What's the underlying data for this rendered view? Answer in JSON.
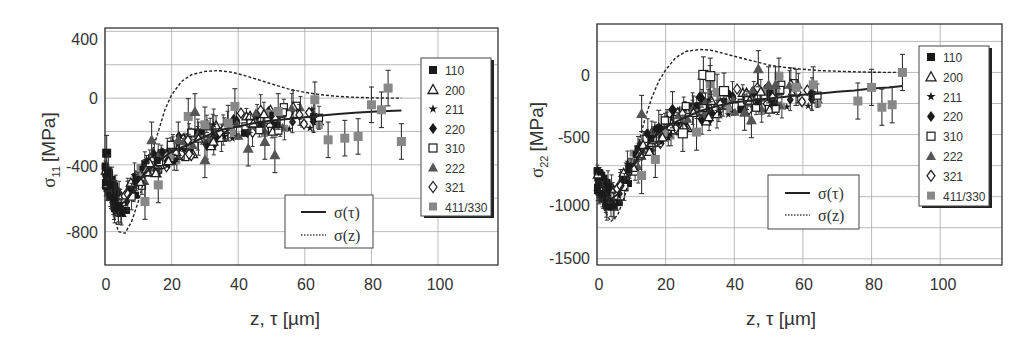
{
  "chart_data": [
    {
      "type": "scatter",
      "id": "sigma11",
      "ylabel": "σ11 [MPa]",
      "ylabel_main": "σ",
      "ylabel_sub": "11",
      "ylabel_unit": "[MPa]",
      "xlabel": "z, τ [µm]",
      "xlim": [
        0,
        118
      ],
      "ylim": [
        -1000,
        420
      ],
      "x_ticks": [
        0,
        20,
        40,
        60,
        80,
        100
      ],
      "y_ticks": [
        400,
        0,
        -400,
        -800
      ],
      "y_grid": [
        400,
        200,
        0,
        -200,
        -400,
        -600,
        -800
      ],
      "grid": true,
      "legend_reflections": [
        "110",
        "200",
        "211",
        "220",
        "310",
        "222",
        "321",
        "411/330"
      ],
      "legend_curves": [
        "σ(τ)",
        "σ(z)"
      ],
      "series": [
        {
          "name": "σ(τ)",
          "style": "solid",
          "x": [
            0,
            2,
            4,
            6,
            8,
            10,
            12,
            15,
            18,
            20,
            25,
            30,
            35,
            40,
            45,
            50,
            55,
            60,
            65,
            70,
            75,
            80,
            85,
            89
          ],
          "y": [
            -450,
            -560,
            -640,
            -620,
            -560,
            -500,
            -450,
            -400,
            -350,
            -320,
            -280,
            -230,
            -190,
            -170,
            -150,
            -135,
            -125,
            -115,
            -105,
            -95,
            -88,
            -82,
            -78,
            -75
          ]
        },
        {
          "name": "σ(z)",
          "style": "dashed",
          "x": [
            0,
            2,
            4,
            6,
            8,
            10,
            12,
            14,
            16,
            18,
            20,
            23,
            26,
            30,
            34,
            38,
            42,
            46,
            50,
            55,
            60,
            65,
            70,
            75,
            80,
            85,
            89
          ],
          "y": [
            -450,
            -650,
            -800,
            -810,
            -740,
            -620,
            -470,
            -330,
            -200,
            -70,
            20,
            100,
            140,
            160,
            165,
            155,
            135,
            110,
            85,
            55,
            35,
            20,
            10,
            5,
            2,
            0,
            0
          ]
        },
        {
          "name": "411/330",
          "style": "marker",
          "x": [
            12,
            16,
            25,
            30,
            37,
            39,
            52,
            63,
            67,
            72,
            76,
            80,
            83,
            85,
            89
          ],
          "y": [
            -620,
            -520,
            -110,
            -160,
            -150,
            -50,
            -80,
            -10,
            -250,
            -240,
            -230,
            -40,
            -70,
            60,
            -260
          ]
        },
        {
          "name": "222",
          "style": "marker",
          "x": [
            14,
            22,
            27,
            30,
            43,
            48,
            51
          ],
          "y": [
            -250,
            -250,
            -80,
            -370,
            -300,
            -260,
            -340
          ]
        },
        {
          "name": "110",
          "style": "marker",
          "x": [
            0.5,
            1,
            2,
            3,
            4
          ],
          "y": [
            -330,
            -450,
            -520,
            -600,
            -650
          ]
        }
      ]
    },
    {
      "type": "scatter",
      "id": "sigma22",
      "ylabel": "σ22 [MPa]",
      "ylabel_main": "σ",
      "ylabel_sub": "22",
      "ylabel_unit": "[MPa]",
      "xlabel": "z, τ [µm]",
      "xlim": [
        0,
        118
      ],
      "ylim": [
        -1550,
        390
      ],
      "x_ticks": [
        0,
        20,
        40,
        60,
        80,
        100
      ],
      "y_ticks": [
        0,
        -500,
        -1000,
        -1500
      ],
      "y_grid": [
        250,
        0,
        -250,
        -500,
        -750,
        -1000,
        -1250,
        -1500
      ],
      "grid": true,
      "legend_reflections": [
        "110",
        "200",
        "211",
        "220",
        "310",
        "222",
        "321",
        "411/330"
      ],
      "legend_curves": [
        "σ(τ)",
        "σ(z)"
      ],
      "series": [
        {
          "name": "σ(τ)",
          "style": "solid",
          "x": [
            0,
            2,
            4,
            6,
            8,
            10,
            13,
            16,
            20,
            25,
            30,
            35,
            40,
            45,
            50,
            55,
            60,
            65,
            70,
            75,
            80,
            85,
            89
          ],
          "y": [
            -850,
            -950,
            -1020,
            -980,
            -880,
            -770,
            -650,
            -540,
            -440,
            -370,
            -310,
            -270,
            -240,
            -225,
            -210,
            -195,
            -180,
            -170,
            -155,
            -145,
            -130,
            -120,
            -110
          ]
        },
        {
          "name": "σ(z)",
          "style": "dashed",
          "x": [
            0,
            2,
            4,
            6,
            8,
            10,
            12,
            14,
            16,
            18,
            20,
            23,
            26,
            30,
            33,
            36,
            40,
            45,
            50,
            55,
            60,
            65,
            70,
            75,
            80,
            85,
            89
          ],
          "y": [
            -900,
            -1100,
            -1200,
            -1150,
            -1000,
            -800,
            -580,
            -370,
            -200,
            -70,
            20,
            120,
            170,
            185,
            180,
            160,
            130,
            95,
            60,
            40,
            25,
            15,
            10,
            5,
            2,
            0,
            0
          ]
        },
        {
          "name": "411/330",
          "style": "marker",
          "x": [
            13,
            17,
            29,
            33,
            35,
            53,
            58,
            63,
            76,
            80,
            83,
            86,
            89
          ],
          "y": [
            -830,
            -700,
            -480,
            -90,
            -160,
            -30,
            -120,
            -100,
            -230,
            -120,
            -280,
            -260,
            0
          ]
        },
        {
          "name": "222",
          "style": "marker",
          "x": [
            13,
            47,
            50,
            52,
            43,
            45
          ],
          "y": [
            -330,
            30,
            -100,
            -100,
            -320,
            -380
          ]
        },
        {
          "name": "310",
          "style": "marker",
          "x": [
            31,
            33,
            37,
            25
          ],
          "y": [
            -20,
            -30,
            -150,
            -490
          ]
        },
        {
          "name": "220",
          "style": "marker",
          "x": [
            22,
            30,
            18
          ],
          "y": [
            -300,
            -200,
            -450
          ]
        }
      ]
    }
  ],
  "charts": {
    "left": {
      "x_tick_labels": [
        "0",
        "20",
        "40",
        "60",
        "80",
        "100"
      ],
      "y_tick_labels": [
        "400",
        "0",
        "-400",
        "-800"
      ],
      "ylabel_main": "σ",
      "ylabel_sub": "11",
      "ylabel_unit": "[MPa]",
      "xlabel": "z, τ [µm]",
      "legend": [
        "110",
        "200",
        "211",
        "220",
        "310",
        "222",
        "321",
        "411/330"
      ],
      "curve_legend": [
        "σ(τ)",
        "σ(z)"
      ]
    },
    "right": {
      "x_tick_labels": [
        "0",
        "20",
        "40",
        "60",
        "80",
        "100"
      ],
      "y_tick_labels": [
        "0",
        "-500",
        "-1000",
        "-1500"
      ],
      "ylabel_main": "σ",
      "ylabel_sub": "22",
      "ylabel_unit": "[MPa]",
      "xlabel": "z, τ [µm]",
      "legend": [
        "110",
        "200",
        "211",
        "220",
        "310",
        "222",
        "321",
        "411/330"
      ],
      "curve_legend": [
        "σ(τ)",
        "σ(z)"
      ]
    }
  },
  "colors": {
    "axis": "#333333",
    "grid": "#aaaaaa",
    "marker_dark": "#1a1a1a",
    "marker_gray": "#888888",
    "curve": "#222222"
  }
}
